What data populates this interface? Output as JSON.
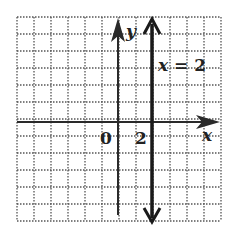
{
  "chart_data": {
    "type": "line",
    "title": "",
    "xlabel": "x",
    "ylabel": "y",
    "xlim": [
      -6,
      6
    ],
    "ylim": [
      -5,
      7
    ],
    "grid": true,
    "grid_style": "dotted",
    "origin_label": "0",
    "x_tick_labels": [
      {
        "value": 2,
        "label": "2"
      }
    ],
    "series": [
      {
        "name": "x = 2",
        "kind": "vertical-line",
        "x": 2,
        "points": [
          {
            "x": 2,
            "y": -5
          },
          {
            "x": 2,
            "y": 7
          }
        ],
        "arrows": "both"
      }
    ],
    "annotations": [
      {
        "text": "x = 2",
        "x": 2.1,
        "y": 4.5
      }
    ]
  },
  "labels": {
    "x_axis": "x",
    "y_axis": "y",
    "origin": "0",
    "tick_2": "2",
    "line_label": "x = 2"
  },
  "colors": {
    "grid": "#555555",
    "axis": "#2a2a2a",
    "line": "#1a1a1a",
    "background": "#ffffff"
  }
}
